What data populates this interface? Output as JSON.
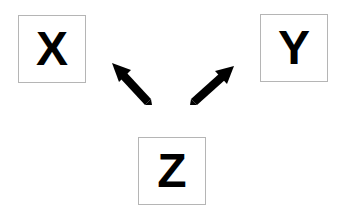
{
  "diagram": {
    "nodes": [
      {
        "id": "x",
        "label": "X"
      },
      {
        "id": "y",
        "label": "Y"
      },
      {
        "id": "z",
        "label": "Z"
      }
    ],
    "edges": [
      {
        "from": "z",
        "to": "x"
      },
      {
        "from": "z",
        "to": "y"
      }
    ],
    "colors": {
      "border": "#b5b5b5",
      "text": "#000000",
      "arrow": "#000000"
    }
  }
}
